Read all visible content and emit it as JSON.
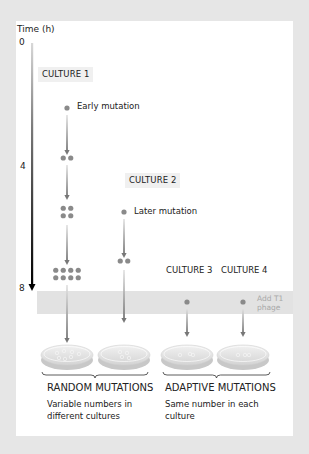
{
  "axis": {
    "title": "Time (h)",
    "ticks": [
      "0",
      "4",
      "8"
    ]
  },
  "cultures": [
    {
      "label": "CULTURE 1",
      "annotation": "Early mutation",
      "dot_counts": [
        1,
        2,
        4,
        8
      ]
    },
    {
      "label": "CULTURE 2",
      "annotation": "Later mutation",
      "dot_counts": [
        1,
        2
      ]
    },
    {
      "label": "CULTURE 3",
      "dot_counts": [
        1
      ]
    },
    {
      "label": "CULTURE 4",
      "dot_counts": [
        1
      ]
    }
  ],
  "band_label": "Add T1 phage",
  "results": [
    {
      "heading": "RANDOM MUTATIONS",
      "description": "Variable numbers in different cultures"
    },
    {
      "heading": "ADAPTIVE MUTATIONS",
      "description": "Same number in each culture"
    }
  ],
  "colors": {
    "background": "#e6e6e6",
    "panel": "#ffffff",
    "dot": "#8a8a8a",
    "band": "#e2e2e2",
    "axis": "#111111",
    "label_box": "#f0f0f0"
  }
}
